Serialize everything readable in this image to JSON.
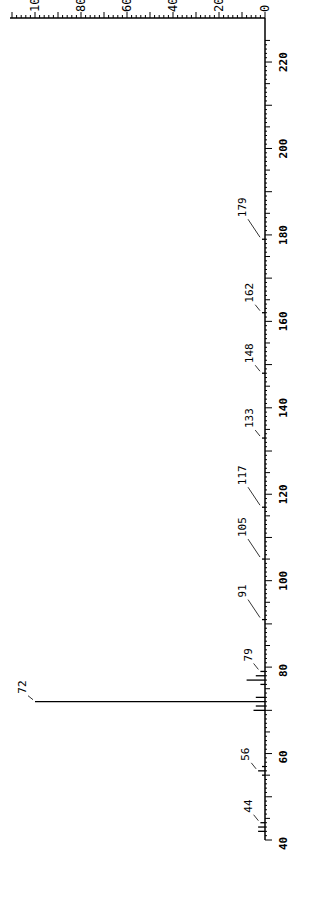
{
  "chart_data": {
    "type": "bar",
    "orientation": "rotated-90",
    "title": "",
    "xlabel": "m/z",
    "ylabel": "Relative Intensity",
    "xlim": [
      40,
      225
    ],
    "ylim": [
      0,
      100
    ],
    "x_ticks": [
      40,
      60,
      80,
      100,
      120,
      140,
      160,
      180,
      200,
      220
    ],
    "y_ticks": [
      0,
      20,
      40,
      60,
      80,
      100
    ],
    "y_tick_labels": [
      "0",
      "20",
      "40",
      "60",
      "80",
      "10"
    ],
    "peaks": [
      {
        "mz": 42,
        "intensity": 3
      },
      {
        "mz": 43,
        "intensity": 3
      },
      {
        "mz": 44,
        "intensity": 2,
        "label": "44"
      },
      {
        "mz": 55,
        "intensity": 1
      },
      {
        "mz": 56,
        "intensity": 3,
        "label": "56"
      },
      {
        "mz": 57,
        "intensity": 1
      },
      {
        "mz": 70,
        "intensity": 5
      },
      {
        "mz": 71,
        "intensity": 4
      },
      {
        "mz": 72,
        "intensity": 100,
        "label": "72"
      },
      {
        "mz": 73,
        "intensity": 4
      },
      {
        "mz": 76,
        "intensity": 2
      },
      {
        "mz": 77,
        "intensity": 8
      },
      {
        "mz": 78,
        "intensity": 4
      },
      {
        "mz": 79,
        "intensity": 2,
        "label": "79"
      },
      {
        "mz": 91,
        "intensity": 1,
        "label": "91"
      },
      {
        "mz": 105,
        "intensity": 1,
        "label": "105"
      },
      {
        "mz": 117,
        "intensity": 1,
        "label": "117"
      },
      {
        "mz": 133,
        "intensity": 0.5,
        "label": "133"
      },
      {
        "mz": 148,
        "intensity": 0.5,
        "label": "148"
      },
      {
        "mz": 162,
        "intensity": 0.5,
        "label": "162"
      },
      {
        "mz": 179,
        "intensity": 0.5,
        "label": "179"
      }
    ]
  }
}
